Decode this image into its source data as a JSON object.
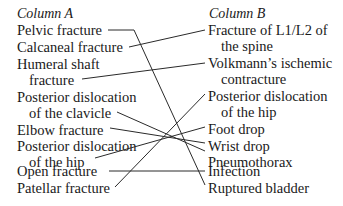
{
  "column_a": {
    "header": "Column A",
    "items": [
      {
        "lines": [
          "Pelvic fracture"
        ]
      },
      {
        "lines": [
          "Calcaneal fracture"
        ]
      },
      {
        "lines": [
          "Humeral shaft",
          "fracture"
        ]
      },
      {
        "lines": [
          "Posterior dislocation",
          "of the clavicle"
        ]
      },
      {
        "lines": [
          "Elbow fracture"
        ]
      },
      {
        "lines": [
          "Posterior dislocation",
          "of the hip"
        ]
      },
      {
        "lines": [
          "Open fracture"
        ]
      },
      {
        "lines": [
          "Patellar fracture"
        ]
      }
    ]
  },
  "column_b": {
    "header": "Column B",
    "items": [
      {
        "lines": [
          "Fracture of L1/L2 of",
          "the spine"
        ]
      },
      {
        "lines": [
          "Volkmann’s ischemic",
          "contracture"
        ]
      },
      {
        "lines": [
          "Posterior dislocation",
          "of the hip"
        ]
      },
      {
        "lines": [
          "Foot drop"
        ]
      },
      {
        "lines": [
          "Wrist drop"
        ]
      },
      {
        "lines": [
          "Pneumothorax"
        ]
      },
      {
        "lines": [
          "Infection"
        ]
      },
      {
        "lines": [
          "Ruptured bladder"
        ]
      }
    ]
  },
  "matches": [
    {
      "a": "Pelvic fracture",
      "b": "Ruptured bladder"
    },
    {
      "a": "Calcaneal fracture",
      "b": "Fracture of L1/L2 of the spine"
    },
    {
      "a": "Humeral shaft fracture",
      "b": "Volkmann’s ischemic contracture"
    },
    {
      "a": "Posterior dislocation of the clavicle",
      "b": "Pneumothorax"
    },
    {
      "a": "Elbow fracture",
      "b": "Wrist drop"
    },
    {
      "a": "Posterior dislocation of the hip",
      "b": "Foot drop"
    },
    {
      "a": "Open fracture",
      "b": "Infection"
    },
    {
      "a": "Patellar fracture",
      "b": "Posterior dislocation of the hip"
    }
  ]
}
